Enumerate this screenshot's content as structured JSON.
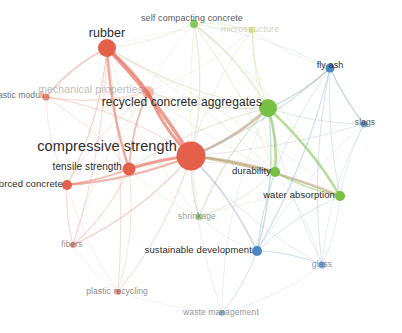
{
  "visualization": {
    "type": "bibliometric-network-map",
    "tool": "VOSviewer",
    "background": "#ffffff",
    "width": 402,
    "height": 333,
    "cluster_colors": {
      "red": "#e4604a",
      "green": "#76c043",
      "blue": "#4a87c3",
      "yellow": "#cdd64b"
    }
  },
  "nodes": [
    {
      "id": "compressive-strength",
      "label": "compressive strength",
      "x": 191,
      "y": 156,
      "r": 14.5,
      "cluster": "red",
      "font": 14.5,
      "lx": 177,
      "ly": 146,
      "anchor": "end-left",
      "opacity": 1.0,
      "label_color": "#2b2b2b"
    },
    {
      "id": "rubber",
      "label": "rubber",
      "x": 107,
      "y": 48,
      "r": 9.0,
      "cluster": "red",
      "font": 12.5,
      "lx": 107,
      "ly": 33,
      "anchor": "center",
      "opacity": 1.0,
      "label_color": "#2b2b2b"
    },
    {
      "id": "recycled-concrete-aggregates",
      "label": "recycled concrete aggregates",
      "x": 268,
      "y": 108,
      "r": 9.0,
      "cluster": "green",
      "font": 12.0,
      "lx": 262,
      "ly": 102,
      "anchor": "end-left",
      "opacity": 1.0,
      "label_color": "#2b2b2b"
    },
    {
      "id": "tensile-strength",
      "label": "tensile strength",
      "x": 129,
      "y": 169,
      "r": 6.5,
      "cluster": "red",
      "font": 10.0,
      "lx": 122,
      "ly": 166,
      "anchor": "end-left",
      "opacity": 1.0,
      "label_color": "#2b2b2b"
    },
    {
      "id": "mechanical-properties",
      "label": "mechanical properties",
      "x": 148,
      "y": 92,
      "r": 6.0,
      "cluster": "red",
      "font": 10.5,
      "lx": 143,
      "ly": 89,
      "anchor": "end-left",
      "opacity": 0.4,
      "label_color": "#6f6f6f"
    },
    {
      "id": "durability",
      "label": "durability",
      "x": 275,
      "y": 172,
      "r": 5.0,
      "cluster": "green",
      "font": 9.5,
      "lx": 271,
      "ly": 170,
      "anchor": "end-left",
      "opacity": 1.0,
      "label_color": "#2b2b2b"
    },
    {
      "id": "water-absorption",
      "label": "water absorption",
      "x": 340,
      "y": 196,
      "r": 5.0,
      "cluster": "green",
      "font": 9.5,
      "lx": 335,
      "ly": 194,
      "anchor": "end-left",
      "opacity": 1.0,
      "label_color": "#2b2b2b"
    },
    {
      "id": "reinforced-concrete",
      "label": "reinforced concrete",
      "x": 67,
      "y": 185,
      "r": 5.0,
      "cluster": "red",
      "font": 9.5,
      "lx": 63,
      "ly": 183,
      "anchor": "end-left",
      "opacity": 1.0,
      "label_color": "#2b2b2b"
    },
    {
      "id": "sustainable-development",
      "label": "sustainable development",
      "x": 257,
      "y": 251,
      "r": 5.0,
      "cluster": "blue",
      "font": 9.5,
      "lx": 252,
      "ly": 249,
      "anchor": "end-left",
      "opacity": 1.0,
      "label_color": "#2b2b2b"
    },
    {
      "id": "fly-ash",
      "label": "fly ash",
      "x": 330,
      "y": 68,
      "r": 4.5,
      "cluster": "blue",
      "font": 9.0,
      "lx": 330,
      "ly": 65,
      "anchor": "center",
      "opacity": 1.0,
      "label_color": "#2b2b2b"
    },
    {
      "id": "self-compacting-concrete",
      "label": "self compacting concrete",
      "x": 194,
      "y": 24,
      "r": 4.0,
      "cluster": "green",
      "font": 9.0,
      "lx": 192,
      "ly": 18,
      "anchor": "center",
      "opacity": 0.85,
      "label_color": "#3a3a3a"
    },
    {
      "id": "elastic-moduli",
      "label": "elastic moduli",
      "x": 46,
      "y": 97,
      "r": 3.5,
      "cluster": "red",
      "font": 8.5,
      "lx": 44,
      "ly": 95,
      "anchor": "end-left",
      "opacity": 0.75,
      "label_color": "#3a3a3a"
    },
    {
      "id": "slags",
      "label": "slags",
      "x": 364,
      "y": 124,
      "r": 3.5,
      "cluster": "blue",
      "font": 8.5,
      "lx": 365,
      "ly": 122,
      "anchor": "center",
      "opacity": 0.8,
      "label_color": "#3a3a3a"
    },
    {
      "id": "shrinkage",
      "label": "shrinkage",
      "x": 199,
      "y": 217,
      "r": 3.5,
      "cluster": "green",
      "font": 8.5,
      "lx": 197,
      "ly": 216,
      "anchor": "center",
      "opacity": 0.55,
      "label_color": "#4a4a4a"
    },
    {
      "id": "glass",
      "label": "glass",
      "x": 322,
      "y": 265,
      "r": 3.5,
      "cluster": "blue",
      "font": 8.5,
      "lx": 322,
      "ly": 264,
      "anchor": "center",
      "opacity": 0.7,
      "label_color": "#5a6a85"
    },
    {
      "id": "fibers",
      "label": "fibers",
      "x": 73,
      "y": 245,
      "r": 3.0,
      "cluster": "red",
      "font": 8.5,
      "lx": 72,
      "ly": 244,
      "anchor": "center",
      "opacity": 0.6,
      "label_color": "#4a4a4a"
    },
    {
      "id": "plastic-recycling",
      "label": "plastic recycling",
      "x": 118,
      "y": 292,
      "r": 3.0,
      "cluster": "red",
      "font": 8.5,
      "lx": 117,
      "ly": 291,
      "anchor": "center",
      "opacity": 0.6,
      "label_color": "#3a3a3a"
    },
    {
      "id": "waste-management",
      "label": "waste management",
      "x": 222,
      "y": 313,
      "r": 3.0,
      "cluster": "blue",
      "font": 8.5,
      "lx": 221,
      "ly": 312,
      "anchor": "center",
      "opacity": 0.55,
      "label_color": "#3a3a3a"
    },
    {
      "id": "microstructure",
      "label": "microstructure",
      "x": 252,
      "y": 30,
      "r": 3.5,
      "cluster": "yellow",
      "font": 9.0,
      "lx": 250,
      "ly": 29,
      "anchor": "center",
      "opacity": 0.45,
      "label_color": "#9aa06a"
    }
  ],
  "edges": [
    {
      "s": "compressive-strength",
      "t": "rubber",
      "w": 3.6,
      "c": "#e4604a"
    },
    {
      "s": "compressive-strength",
      "t": "tensile-strength",
      "w": 3.2,
      "c": "#e4604a"
    },
    {
      "s": "compressive-strength",
      "t": "mechanical-properties",
      "w": 3.0,
      "c": "#e4604a"
    },
    {
      "s": "compressive-strength",
      "t": "recycled-concrete-aggregates",
      "w": 2.8,
      "c": "#b79a6e"
    },
    {
      "s": "compressive-strength",
      "t": "durability",
      "w": 2.4,
      "c": "#b09a63"
    },
    {
      "s": "compressive-strength",
      "t": "water-absorption",
      "w": 2.6,
      "c": "#b09a63"
    },
    {
      "s": "compressive-strength",
      "t": "reinforced-concrete",
      "w": 2.0,
      "c": "#e4604a"
    },
    {
      "s": "compressive-strength",
      "t": "sustainable-development",
      "w": 1.6,
      "c": "#9aa8b8"
    },
    {
      "s": "compressive-strength",
      "t": "fly-ash",
      "w": 1.3,
      "c": "#a0aec4"
    },
    {
      "s": "compressive-strength",
      "t": "shrinkage",
      "w": 1.2,
      "c": "#b5bda0"
    },
    {
      "s": "compressive-strength",
      "t": "fibers",
      "w": 1.2,
      "c": "#e0836e"
    },
    {
      "s": "compressive-strength",
      "t": "self-compacting-concrete",
      "w": 1.2,
      "c": "#b9c490"
    },
    {
      "s": "compressive-strength",
      "t": "elastic-moduli",
      "w": 1.0,
      "c": "#e0836e"
    },
    {
      "s": "compressive-strength",
      "t": "plastic-recycling",
      "w": 1.0,
      "c": "#e0836e"
    },
    {
      "s": "compressive-strength",
      "t": "glass",
      "w": 0.9,
      "c": "#a3b4cb"
    },
    {
      "s": "compressive-strength",
      "t": "slags",
      "w": 0.9,
      "c": "#a3b4cb"
    },
    {
      "s": "compressive-strength",
      "t": "microstructure",
      "w": 0.9,
      "c": "#c3c890"
    },
    {
      "s": "compressive-strength",
      "t": "waste-management",
      "w": 0.8,
      "c": "#a8b6c8"
    },
    {
      "s": "rubber",
      "t": "mechanical-properties",
      "w": 2.6,
      "c": "#e4604a"
    },
    {
      "s": "rubber",
      "t": "tensile-strength",
      "w": 2.4,
      "c": "#e4604a"
    },
    {
      "s": "rubber",
      "t": "elastic-moduli",
      "w": 1.6,
      "c": "#e0836e"
    },
    {
      "s": "rubber",
      "t": "reinforced-concrete",
      "w": 1.2,
      "c": "#e0836e"
    },
    {
      "s": "rubber",
      "t": "fibers",
      "w": 1.1,
      "c": "#e69b86"
    },
    {
      "s": "rubber",
      "t": "plastic-recycling",
      "w": 1.1,
      "c": "#e69b86"
    },
    {
      "s": "rubber",
      "t": "recycled-concrete-aggregates",
      "w": 1.0,
      "c": "#c8b086"
    },
    {
      "s": "rubber",
      "t": "self-compacting-concrete",
      "w": 0.9,
      "c": "#c3c79a"
    },
    {
      "s": "rubber",
      "t": "durability",
      "w": 0.8,
      "c": "#c3b58e"
    },
    {
      "s": "rubber",
      "t": "water-absorption",
      "w": 0.7,
      "c": "#c3b58e"
    },
    {
      "s": "rubber",
      "t": "shrinkage",
      "w": 0.7,
      "c": "#c6c8a6"
    },
    {
      "s": "rubber",
      "t": "sustainable-development",
      "w": 0.6,
      "c": "#b8bcc8"
    },
    {
      "s": "rubber",
      "t": "microstructure",
      "w": 0.6,
      "c": "#cdd0a0"
    },
    {
      "s": "recycled-concrete-aggregates",
      "t": "durability",
      "w": 2.6,
      "c": "#76c043"
    },
    {
      "s": "recycled-concrete-aggregates",
      "t": "water-absorption",
      "w": 2.4,
      "c": "#76c043"
    },
    {
      "s": "recycled-concrete-aggregates",
      "t": "fly-ash",
      "w": 1.5,
      "c": "#8ab49a"
    },
    {
      "s": "recycled-concrete-aggregates",
      "t": "sustainable-development",
      "w": 1.5,
      "c": "#8fb3ae"
    },
    {
      "s": "recycled-concrete-aggregates",
      "t": "shrinkage",
      "w": 1.2,
      "c": "#9bc274"
    },
    {
      "s": "recycled-concrete-aggregates",
      "t": "mechanical-properties",
      "w": 1.2,
      "c": "#c4a86e"
    },
    {
      "s": "recycled-concrete-aggregates",
      "t": "self-compacting-concrete",
      "w": 1.1,
      "c": "#96c65e"
    },
    {
      "s": "recycled-concrete-aggregates",
      "t": "microstructure",
      "w": 1.0,
      "c": "#b5c85a"
    },
    {
      "s": "recycled-concrete-aggregates",
      "t": "slags",
      "w": 0.9,
      "c": "#92b6a8"
    },
    {
      "s": "recycled-concrete-aggregates",
      "t": "glass",
      "w": 0.8,
      "c": "#92b2bc"
    },
    {
      "s": "recycled-concrete-aggregates",
      "t": "tensile-strength",
      "w": 1.0,
      "c": "#c8a878"
    },
    {
      "s": "recycled-concrete-aggregates",
      "t": "waste-management",
      "w": 0.7,
      "c": "#9ab4bd"
    },
    {
      "s": "tensile-strength",
      "t": "mechanical-properties",
      "w": 1.8,
      "c": "#e4604a"
    },
    {
      "s": "tensile-strength",
      "t": "reinforced-concrete",
      "w": 1.8,
      "c": "#e4604a"
    },
    {
      "s": "tensile-strength",
      "t": "fibers",
      "w": 1.2,
      "c": "#e69b86"
    },
    {
      "s": "tensile-strength",
      "t": "elastic-moduli",
      "w": 1.0,
      "c": "#e9a895"
    },
    {
      "s": "tensile-strength",
      "t": "plastic-recycling",
      "w": 0.9,
      "c": "#e9a895"
    },
    {
      "s": "tensile-strength",
      "t": "durability",
      "w": 0.8,
      "c": "#c6b184"
    },
    {
      "s": "tensile-strength",
      "t": "shrinkage",
      "w": 0.8,
      "c": "#c9c8a4"
    },
    {
      "s": "mechanical-properties",
      "t": "elastic-moduli",
      "w": 1.4,
      "c": "#e9a895"
    },
    {
      "s": "mechanical-properties",
      "t": "reinforced-concrete",
      "w": 1.0,
      "c": "#e9a895"
    },
    {
      "s": "mechanical-properties",
      "t": "self-compacting-concrete",
      "w": 0.8,
      "c": "#c8cca4"
    },
    {
      "s": "mechanical-properties",
      "t": "durability",
      "w": 0.8,
      "c": "#cbb890"
    },
    {
      "s": "mechanical-properties",
      "t": "microstructure",
      "w": 0.8,
      "c": "#cdd0a0"
    },
    {
      "s": "mechanical-properties",
      "t": "fibers",
      "w": 0.8,
      "c": "#eaaa98"
    },
    {
      "s": "durability",
      "t": "water-absorption",
      "w": 1.6,
      "c": "#76c043"
    },
    {
      "s": "durability",
      "t": "sustainable-development",
      "w": 1.2,
      "c": "#8fb7b5"
    },
    {
      "s": "durability",
      "t": "shrinkage",
      "w": 0.9,
      "c": "#a8c882"
    },
    {
      "s": "durability",
      "t": "fly-ash",
      "w": 0.9,
      "c": "#94bba4"
    },
    {
      "s": "durability",
      "t": "glass",
      "w": 0.7,
      "c": "#9ab8c0"
    },
    {
      "s": "water-absorption",
      "t": "fly-ash",
      "w": 1.0,
      "c": "#92baa6"
    },
    {
      "s": "water-absorption",
      "t": "sustainable-development",
      "w": 1.0,
      "c": "#90b7b8"
    },
    {
      "s": "water-absorption",
      "t": "slags",
      "w": 0.8,
      "c": "#93b8b0"
    },
    {
      "s": "water-absorption",
      "t": "glass",
      "w": 0.8,
      "c": "#93b5c0"
    },
    {
      "s": "fly-ash",
      "t": "slags",
      "w": 1.2,
      "c": "#4a87c3"
    },
    {
      "s": "fly-ash",
      "t": "sustainable-development",
      "w": 1.1,
      "c": "#6f9fcd"
    },
    {
      "s": "fly-ash",
      "t": "glass",
      "w": 0.9,
      "c": "#6f9fcd"
    },
    {
      "s": "fly-ash",
      "t": "self-compacting-concrete",
      "w": 0.8,
      "c": "#a2bcbe"
    },
    {
      "s": "fly-ash",
      "t": "microstructure",
      "w": 0.7,
      "c": "#b6c39c"
    },
    {
      "s": "sustainable-development",
      "t": "glass",
      "w": 1.1,
      "c": "#6f9fcd"
    },
    {
      "s": "sustainable-development",
      "t": "waste-management",
      "w": 1.0,
      "c": "#7ba6d0"
    },
    {
      "s": "sustainable-development",
      "t": "slags",
      "w": 0.7,
      "c": "#85aad2"
    },
    {
      "s": "sustainable-development",
      "t": "shrinkage",
      "w": 0.7,
      "c": "#a8bcb8"
    },
    {
      "s": "reinforced-concrete",
      "t": "fibers",
      "w": 1.2,
      "c": "#e69b86"
    },
    {
      "s": "reinforced-concrete",
      "t": "elastic-moduli",
      "w": 0.9,
      "c": "#eaaa98"
    },
    {
      "s": "reinforced-concrete",
      "t": "plastic-recycling",
      "w": 0.8,
      "c": "#eaaa98"
    },
    {
      "s": "fibers",
      "t": "plastic-recycling",
      "w": 0.8,
      "c": "#eeb8a8"
    },
    {
      "s": "self-compacting-concrete",
      "t": "microstructure",
      "w": 0.9,
      "c": "#c2cc78"
    },
    {
      "s": "self-compacting-concrete",
      "t": "shrinkage",
      "w": 0.7,
      "c": "#aecb7e"
    },
    {
      "s": "self-compacting-concrete",
      "t": "durability",
      "w": 0.8,
      "c": "#8ec356"
    },
    {
      "s": "self-compacting-concrete",
      "t": "water-absorption",
      "w": 0.7,
      "c": "#92c460"
    },
    {
      "s": "waste-management",
      "t": "glass",
      "w": 0.7,
      "c": "#8cade0"
    },
    {
      "s": "waste-management",
      "t": "plastic-recycling",
      "w": 0.6,
      "c": "#d0a8b0"
    },
    {
      "s": "shrinkage",
      "t": "water-absorption",
      "w": 0.7,
      "c": "#a6c888"
    },
    {
      "s": "slags",
      "t": "glass",
      "w": 0.7,
      "c": "#7ba6d0"
    },
    {
      "s": "microstructure",
      "t": "durability",
      "w": 0.7,
      "c": "#bdcc70"
    }
  ]
}
